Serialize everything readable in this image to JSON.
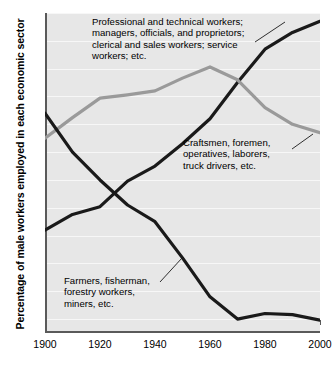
{
  "chart_data": {
    "type": "line",
    "title": "",
    "xlabel": "",
    "ylabel": "Percentage of male workers employed in each economic sector",
    "xlim": [
      1900,
      2000
    ],
    "ylim": [
      2.5,
      60
    ],
    "ytick_values": [
      5,
      10,
      15,
      20,
      25,
      30,
      35,
      40,
      45,
      50,
      55,
      60
    ],
    "ytick_labels": [
      "5",
      "10",
      "15",
      "20",
      "25",
      "30",
      "35",
      "40",
      "45",
      "50",
      "55",
      "60"
    ],
    "xtick_values": [
      1900,
      1920,
      1940,
      1960,
      1980,
      2000
    ],
    "xtick_labels": [
      "1900",
      "1920",
      "1940",
      "1960",
      "1980",
      "2000"
    ],
    "xtick_minor": [
      1910,
      1930,
      1950,
      1970,
      1990
    ],
    "grid": "horizontal-white",
    "legend": "inline-annotations",
    "plot_background": "#e7e7e7",
    "x": [
      1900,
      1910,
      1920,
      1930,
      1940,
      1950,
      1960,
      1970,
      1980,
      1990,
      2000
    ],
    "series": [
      {
        "name": "Professional and technical workers; managers, officials, and proprietors; clerical and sales workers; service workers; etc.",
        "short_name": "white-collar",
        "color": "#1a1a1a",
        "values": [
          21.0,
          23.8,
          25.2,
          29.8,
          32.5,
          36.5,
          41.0,
          47.5,
          53.5,
          56.5,
          58.5
        ]
      },
      {
        "name": "Craftsmen, foremen, operatives, laborers, truck drivers, etc.",
        "short_name": "blue-collar",
        "color": "#9a9a9a",
        "values": [
          37.5,
          41.2,
          44.7,
          45.3,
          46.0,
          48.3,
          50.3,
          48.0,
          43.0,
          40.0,
          38.5
        ]
      },
      {
        "name": "Farmers, fisherman, forestry workers, miners, etc.",
        "short_name": "farm",
        "color": "#1a1a1a",
        "values": [
          42.0,
          35.0,
          30.0,
          25.5,
          22.5,
          16.0,
          9.0,
          5.0,
          6.0,
          5.8,
          4.8
        ]
      }
    ],
    "annotations": [
      {
        "id": "white-collar",
        "lines": [
          "Professional and technical workers;",
          "managers, officials, and proprietors;",
          "clerical and sales workers; service",
          "workers; etc."
        ]
      },
      {
        "id": "blue-collar",
        "lines": [
          "Craftsmen, foremen,",
          "operatives, laborers,",
          "truck drivers, etc."
        ]
      },
      {
        "id": "farm",
        "lines": [
          "Farmers, fisherman,",
          "forestry workers,",
          "miners, etc."
        ]
      }
    ]
  }
}
